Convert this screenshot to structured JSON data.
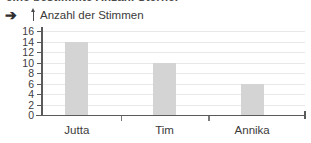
{
  "page": {
    "cropped_heading": "eine bestimmte Anzahl Sterne.",
    "bullet_marker": "➔"
  },
  "chart_data": {
    "type": "bar",
    "title": "",
    "ylabel": "Anzahl der Stimmen",
    "xlabel": "",
    "categories": [
      "Jutta",
      "Tim",
      "Annika"
    ],
    "values": [
      14,
      10,
      6
    ],
    "ylim": [
      0,
      16
    ],
    "ytick_step": 2,
    "ytick_labels": [
      "0",
      "2",
      "4",
      "6",
      "8",
      "10",
      "12",
      "14",
      "16"
    ],
    "grid": true,
    "legend": "none",
    "bar_color": "#d4d4d4",
    "axis_color": "#5a5a5a",
    "grid_color": "#e8e8e8"
  }
}
